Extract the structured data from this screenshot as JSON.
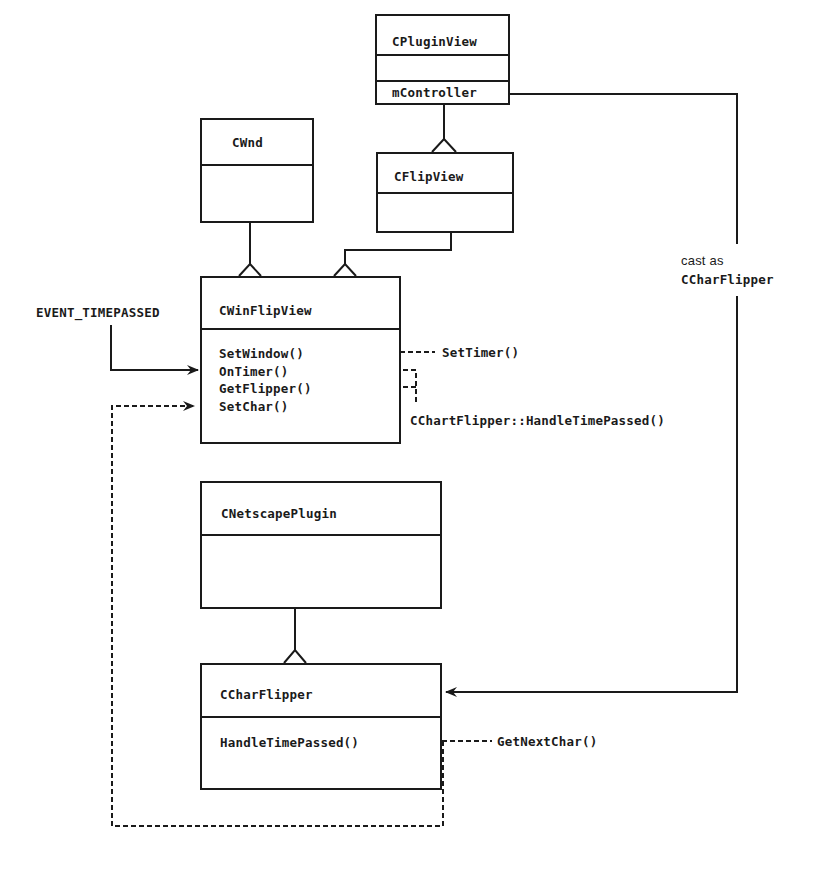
{
  "classes": {
    "cpluginview": {
      "name": "CPluginView",
      "attributes": [],
      "members": [
        "mController"
      ]
    },
    "cwnd": {
      "name": "CWnd",
      "methods": []
    },
    "cflipview": {
      "name": "CFlipView",
      "methods": []
    },
    "cwinflipview": {
      "name": "CWinFlipView",
      "methods": [
        "SetWindow()",
        "OnTimer()",
        "GetFlipper()",
        "SetChar()"
      ]
    },
    "cnetscapeplugin": {
      "name": "CNetscapePlugin",
      "methods": []
    },
    "ccharflipper": {
      "name": "CCharFlipper",
      "methods": [
        "HandleTimePassed()"
      ]
    }
  },
  "annotations": {
    "event": "EVENT_TIMEPASSED",
    "set_timer": "SetTimer()",
    "handle_time_passed": "CChartFlipper::HandleTimePassed()",
    "cast_as": "cast as",
    "cast_type": "CCharFlipper",
    "get_next_char": "GetNextChar()"
  },
  "relationships": [
    {
      "from": "CFlipView",
      "to": "CPluginView",
      "type": "inheritance"
    },
    {
      "from": "CWinFlipView",
      "to": "CWnd",
      "type": "inheritance"
    },
    {
      "from": "CWinFlipView",
      "to": "CFlipView",
      "type": "inheritance"
    },
    {
      "from": "CCharFlipper",
      "to": "CNetscapePlugin",
      "type": "inheritance"
    },
    {
      "from": "CPluginView.mController",
      "to": "CCharFlipper",
      "type": "reference",
      "label": "cast as CCharFlipper"
    }
  ]
}
